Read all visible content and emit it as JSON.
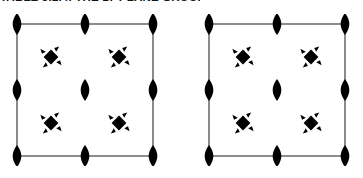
{
  "caption": {
    "text": "TABLE 5.1.4. THE 17 PLANE GROUPS"
  },
  "diagram": {
    "type": "plane-group-symmetry-diagram",
    "line_color": "#8c8c8c",
    "symbol_color": "#000000",
    "background_color": "#ffffff",
    "cells": [
      {
        "name": "left-unit-cell",
        "origin_px": [
          10,
          14
        ],
        "size_px": [
          150,
          152
        ],
        "twofold_axes": [
          {
            "label": "2-fold",
            "col": 0,
            "row": 0
          },
          {
            "label": "2-fold",
            "col": 1,
            "row": 0
          },
          {
            "label": "2-fold",
            "col": 2,
            "row": 0
          },
          {
            "label": "2-fold",
            "col": 0,
            "row": 1
          },
          {
            "label": "2-fold",
            "col": 1,
            "row": 1
          },
          {
            "label": "2-fold",
            "col": 2,
            "row": 1
          },
          {
            "label": "2-fold",
            "col": 0,
            "row": 2
          },
          {
            "label": "2-fold",
            "col": 1,
            "row": 2
          },
          {
            "label": "2-fold",
            "col": 2,
            "row": 2
          }
        ],
        "fourfold_axes": [
          {
            "label": "4-fold",
            "col": 0,
            "row": 0
          },
          {
            "label": "4-fold",
            "col": 1,
            "row": 0
          },
          {
            "label": "4-fold",
            "col": 0,
            "row": 1
          },
          {
            "label": "4-fold",
            "col": 1,
            "row": 1
          }
        ],
        "edges": {
          "top_horizontal": true,
          "middle_horizontal": false,
          "bottom_horizontal": true,
          "left_vertical": true,
          "middle_vertical": false,
          "right_vertical": true
        }
      },
      {
        "name": "right-unit-cell",
        "origin_px": [
          202,
          14
        ],
        "size_px": [
          150,
          152
        ],
        "twofold_axes": [
          {
            "label": "2-fold",
            "col": 0,
            "row": 0
          },
          {
            "label": "2-fold",
            "col": 1,
            "row": 0
          },
          {
            "label": "2-fold",
            "col": 2,
            "row": 0
          },
          {
            "label": "2-fold",
            "col": 0,
            "row": 1
          },
          {
            "label": "2-fold",
            "col": 1,
            "row": 1
          },
          {
            "label": "2-fold",
            "col": 2,
            "row": 1
          },
          {
            "label": "2-fold",
            "col": 0,
            "row": 2
          },
          {
            "label": "2-fold",
            "col": 1,
            "row": 2
          },
          {
            "label": "2-fold",
            "col": 2,
            "row": 2
          }
        ],
        "fourfold_axes": [
          {
            "label": "4-fold",
            "col": 0,
            "row": 0
          },
          {
            "label": "4-fold",
            "col": 1,
            "row": 0
          },
          {
            "label": "4-fold",
            "col": 0,
            "row": 1
          },
          {
            "label": "4-fold",
            "col": 1,
            "row": 1
          }
        ],
        "edges": {
          "top_horizontal": true,
          "middle_horizontal": false,
          "bottom_horizontal": true,
          "left_vertical": true,
          "middle_vertical": false,
          "right_vertical": true
        }
      }
    ]
  }
}
